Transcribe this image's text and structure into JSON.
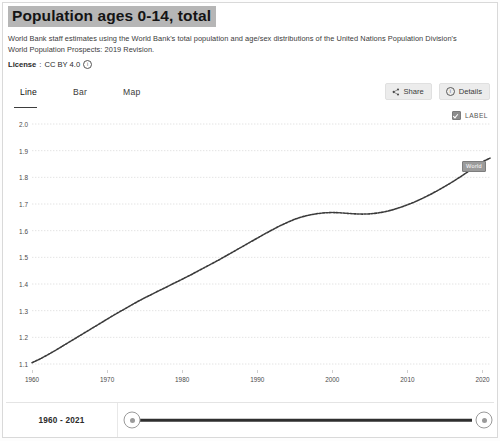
{
  "header": {
    "title": "Population ages 0-14, total",
    "description": "World Bank staff estimates using the World Bank's total population and age/sex distributions of the United Nations Population Division's World Population Prospects: 2019 Revision.",
    "license_label": "License",
    "license_separator": ":",
    "license_value": "CC BY 4.0",
    "info_icon": "info-icon"
  },
  "tabbar": {
    "tabs": [
      {
        "label": "Line",
        "active": true
      },
      {
        "label": "Bar",
        "active": false
      },
      {
        "label": "Map",
        "active": false
      }
    ],
    "share_label": "Share",
    "details_label": "Details",
    "share_icon": "share-icon",
    "details_icon": "info-circle-icon"
  },
  "legend": {
    "label": "LABEL",
    "checked": true
  },
  "point_label": {
    "text": "World"
  },
  "footer": {
    "range_text": "1960 - 2021",
    "slider_min_label": "1960",
    "slider_max_label": "2021"
  },
  "colors": {
    "line": "#3a3a3a",
    "grid": "#dcdcdc",
    "title_highlight": "#b6b6b6",
    "label_badge": "#9b9b9b",
    "track": "#2f2f2f"
  },
  "chart_data": {
    "type": "line",
    "title": "Population ages 0-14, total",
    "xlabel": "",
    "ylabel": "",
    "units": "billions",
    "grid": true,
    "legend_position": "top-right",
    "xlim": [
      1960,
      2021
    ],
    "ylim": [
      1.1,
      2.0
    ],
    "xticks": [
      1960,
      1970,
      1980,
      1990,
      2000,
      2010,
      2020
    ],
    "yticks": [
      1.1,
      1.2,
      1.3,
      1.4,
      1.5,
      1.6,
      1.7,
      1.8,
      1.9,
      2.0
    ],
    "ytick_labels": [
      "1.1",
      "1.2",
      "1.3",
      "1.4",
      "1.5",
      "1.6",
      "1.7",
      "1.8",
      "1.9",
      "2.0"
    ],
    "xtick_labels": [
      "1960",
      "1970",
      "1980",
      "1990",
      "2000",
      "2010",
      "2020"
    ],
    "series": [
      {
        "name": "World",
        "x": [
          1960,
          1961,
          1962,
          1963,
          1964,
          1965,
          1966,
          1967,
          1968,
          1969,
          1970,
          1971,
          1972,
          1973,
          1974,
          1975,
          1976,
          1977,
          1978,
          1979,
          1980,
          1981,
          1982,
          1983,
          1984,
          1985,
          1986,
          1987,
          1988,
          1989,
          1990,
          1991,
          1992,
          1993,
          1994,
          1995,
          1996,
          1997,
          1998,
          1999,
          2000,
          2001,
          2002,
          2003,
          2004,
          2005,
          2006,
          2007,
          2008,
          2009,
          2010,
          2011,
          2012,
          2013,
          2014,
          2015,
          2016,
          2017,
          2018,
          2019,
          2020,
          2021
        ],
        "y": [
          1.105,
          1.118,
          1.133,
          1.149,
          1.166,
          1.183,
          1.2,
          1.217,
          1.234,
          1.251,
          1.268,
          1.285,
          1.301,
          1.317,
          1.333,
          1.348,
          1.362,
          1.376,
          1.39,
          1.404,
          1.418,
          1.432,
          1.447,
          1.462,
          1.477,
          1.492,
          1.508,
          1.524,
          1.54,
          1.556,
          1.572,
          1.588,
          1.603,
          1.618,
          1.631,
          1.643,
          1.652,
          1.659,
          1.664,
          1.667,
          1.668,
          1.667,
          1.665,
          1.663,
          1.662,
          1.663,
          1.666,
          1.671,
          1.678,
          1.687,
          1.697,
          1.708,
          1.721,
          1.735,
          1.75,
          1.766,
          1.783,
          1.801,
          1.82,
          1.84,
          1.858,
          1.872
        ]
      }
    ],
    "annotations": [
      {
        "text": "World",
        "x": 2021,
        "y": 1.872,
        "style": "badge"
      }
    ]
  }
}
